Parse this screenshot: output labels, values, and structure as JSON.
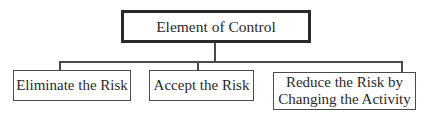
{
  "diagram": {
    "type": "hierarchy",
    "root": {
      "label": "Element of Control"
    },
    "children": [
      {
        "label": "Eliminate the Risk"
      },
      {
        "label": "Accept the Risk"
      },
      {
        "label_line1": "Reduce the Risk by",
        "label_line2": "Changing the Activity"
      }
    ],
    "colors": {
      "line": "#4a4a4a",
      "root_border": "#2a2a2a",
      "text": "#2a2a2a",
      "background": "#ffffff"
    }
  }
}
